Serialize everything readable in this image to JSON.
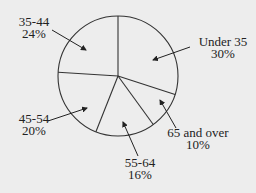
{
  "chart_data": {
    "type": "pie",
    "title": "",
    "start_angle_deg": 0,
    "direction": "clockwise",
    "slices": [
      {
        "label": "Under 35",
        "value": 30,
        "value_label": "30%"
      },
      {
        "label": "65 and over",
        "value": 10,
        "value_label": "10%"
      },
      {
        "label": "55-64",
        "value": 16,
        "value_label": "16%"
      },
      {
        "label": "45-54",
        "value": 20,
        "value_label": "20%"
      },
      {
        "label": "35-44",
        "value": 24,
        "value_label": "24%"
      }
    ],
    "categories": [
      "Under 35",
      "65 and over",
      "55-64",
      "45-54",
      "35-44"
    ],
    "values": [
      30,
      10,
      16,
      20,
      24
    ],
    "legend": "none; labels placed outside with arrows",
    "fill": "none",
    "stroke": "#333333"
  },
  "style": {
    "background": "#ededed",
    "stroke": "#333333",
    "text": "#222222"
  }
}
